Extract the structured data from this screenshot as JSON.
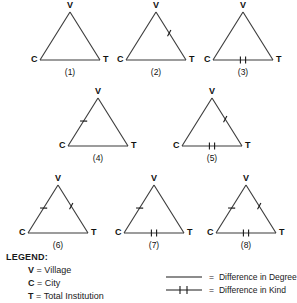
{
  "diagram": {
    "type": "triangle-typology",
    "vertex_labels": {
      "top": "V",
      "bottom_left": "C",
      "bottom_right": "T"
    },
    "edges": {
      "left": "C-V",
      "right": "V-T",
      "bottom": "C-T"
    },
    "marker_types": {
      "degree": "single-slash-tick",
      "kind": "double-vertical-bar"
    },
    "triangles": [
      {
        "id": 1,
        "caption": "(1)",
        "v": "V",
        "c": "C",
        "t": "T",
        "left_edge_marker": "none",
        "right_edge_marker": "none",
        "bottom_edge_marker": "none"
      },
      {
        "id": 2,
        "caption": "(2)",
        "v": "V",
        "c": "C",
        "t": "T",
        "left_edge_marker": "none",
        "right_edge_marker": "degree",
        "bottom_edge_marker": "none"
      },
      {
        "id": 3,
        "caption": "(3)",
        "v": "V",
        "c": "C",
        "t": "T",
        "left_edge_marker": "none",
        "right_edge_marker": "none",
        "bottom_edge_marker": "kind"
      },
      {
        "id": 4,
        "caption": "(4)",
        "v": "V",
        "c": "C",
        "t": "T",
        "left_edge_marker": "degree",
        "right_edge_marker": "none",
        "bottom_edge_marker": "none"
      },
      {
        "id": 5,
        "caption": "(5)",
        "v": "V",
        "c": "C",
        "t": "T",
        "left_edge_marker": "none",
        "right_edge_marker": "degree",
        "bottom_edge_marker": "kind"
      },
      {
        "id": 6,
        "caption": "(6)",
        "v": "V",
        "c": "C",
        "t": "T",
        "left_edge_marker": "degree",
        "right_edge_marker": "degree",
        "bottom_edge_marker": "none"
      },
      {
        "id": 7,
        "caption": "(7)",
        "v": "V",
        "c": "C",
        "t": "T",
        "left_edge_marker": "degree",
        "right_edge_marker": "none",
        "bottom_edge_marker": "kind"
      },
      {
        "id": 8,
        "caption": "(8)",
        "v": "V",
        "c": "C",
        "t": "T",
        "left_edge_marker": "degree",
        "right_edge_marker": "degree",
        "bottom_edge_marker": "kind"
      }
    ]
  },
  "legend": {
    "title": "LEGEND:",
    "definitions": [
      {
        "term": "V",
        "eq": "=",
        "meaning": "Village"
      },
      {
        "term": "C",
        "eq": "=",
        "meaning": "City"
      },
      {
        "term": "T",
        "eq": "=",
        "meaning": "Total Institution"
      }
    ],
    "keys": [
      {
        "symbol": "plain-line",
        "eq": "=",
        "label": "Difference in Degree"
      },
      {
        "symbol": "barred-line",
        "eq": "=",
        "label": "Difference in Kind"
      }
    ]
  },
  "colors": {
    "ink": "#1a1a1a",
    "stroke": "#3a3a3a",
    "background": "#ffffff"
  }
}
